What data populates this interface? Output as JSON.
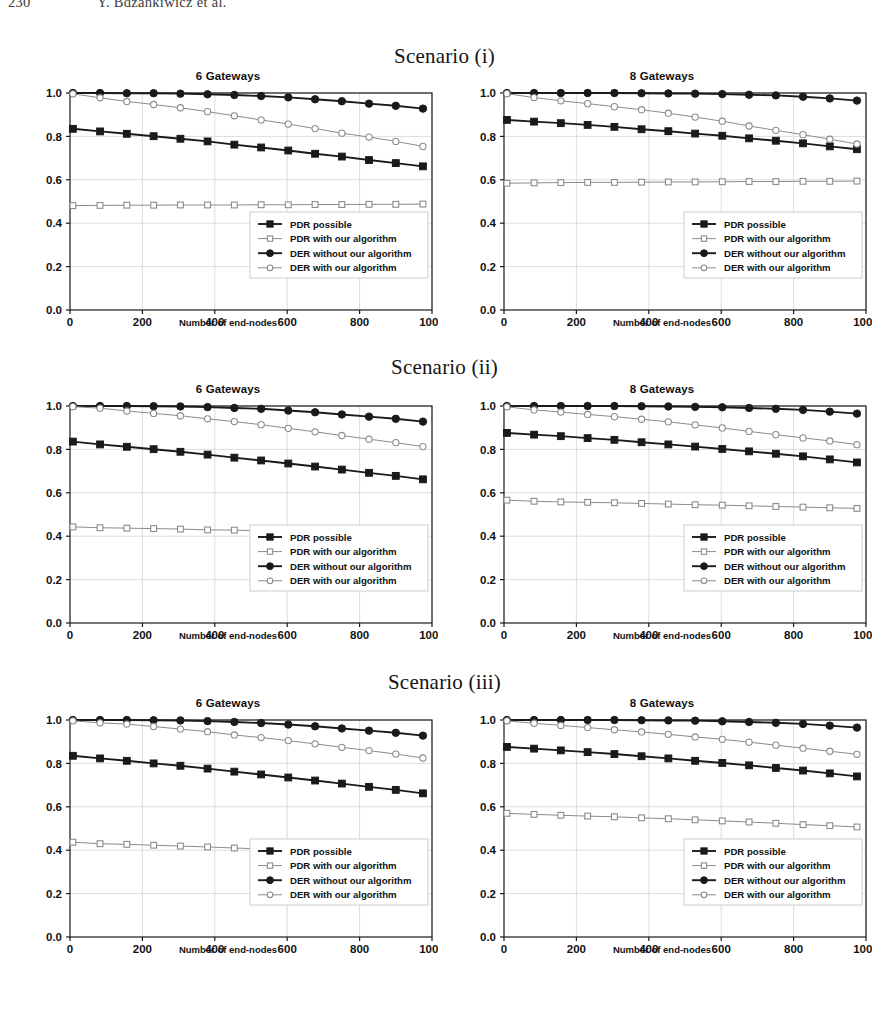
{
  "running_head": {
    "folio": "230",
    "authors": "Y. Bdzahkiwicz et al."
  },
  "scenarios": [
    {
      "caption": "Scenario (i)"
    },
    {
      "caption": "Scenario (ii)"
    },
    {
      "caption": "Scenario (iii)"
    }
  ],
  "legend_labels": [
    "PDR possible",
    "PDR with our algorithm",
    "DER without our algorithm",
    "DER with our algorithm"
  ],
  "colors": {
    "series_dark": "#1a1a1a",
    "series_light": "#8c8c8c",
    "grid": "#d9d9d9",
    "axis": "#1a1a1a",
    "background": "#ffffff",
    "legend_border": "#c8c8c8"
  },
  "chart_data": [
    {
      "type": "line",
      "title": "6 Gateways",
      "scenario": "Scenario (i)",
      "xlabel": "Number of end-nodes",
      "ylabel": "",
      "xlim": [
        0,
        1000
      ],
      "ylim": [
        0.0,
        1.0
      ],
      "xticks": [
        0,
        200,
        400,
        600,
        800,
        1000
      ],
      "yticks": [
        0.0,
        0.2,
        0.4,
        0.6,
        0.8,
        1.0
      ],
      "grid": true,
      "legend_position": "lower right",
      "x": [
        8,
        83,
        157,
        231,
        305,
        380,
        454,
        528,
        603,
        677,
        751,
        826,
        900,
        975
      ],
      "series": [
        {
          "name": "PDR possible",
          "marker": "filled-square",
          "color": "#1a1a1a",
          "values": [
            0.835,
            0.823,
            0.812,
            0.801,
            0.789,
            0.777,
            0.762,
            0.749,
            0.735,
            0.72,
            0.707,
            0.691,
            0.677,
            0.662
          ]
        },
        {
          "name": "PDR with our algorithm",
          "marker": "open-square",
          "color": "#8c8c8c",
          "values": [
            0.481,
            0.482,
            0.483,
            0.483,
            0.484,
            0.484,
            0.484,
            0.485,
            0.485,
            0.486,
            0.486,
            0.487,
            0.487,
            0.488
          ]
        },
        {
          "name": "DER without our algorithm",
          "marker": "filled-circle",
          "color": "#1a1a1a",
          "values": [
            1.0,
            1.0,
            0.999,
            0.999,
            0.997,
            0.994,
            0.991,
            0.986,
            0.98,
            0.971,
            0.962,
            0.951,
            0.941,
            0.928
          ]
        },
        {
          "name": "DER with our algorithm",
          "marker": "open-circle",
          "color": "#8c8c8c",
          "values": [
            0.996,
            0.978,
            0.961,
            0.947,
            0.932,
            0.914,
            0.895,
            0.876,
            0.857,
            0.836,
            0.815,
            0.797,
            0.777,
            0.754
          ]
        }
      ]
    },
    {
      "type": "line",
      "title": "8 Gateways",
      "scenario": "Scenario (i)",
      "xlabel": "Number of end-nodes",
      "ylabel": "",
      "xlim": [
        0,
        1000
      ],
      "ylim": [
        0.0,
        1.0
      ],
      "xticks": [
        0,
        200,
        400,
        600,
        800,
        1000
      ],
      "yticks": [
        0.0,
        0.2,
        0.4,
        0.6,
        0.8,
        1.0
      ],
      "grid": true,
      "legend_position": "lower right",
      "x": [
        8,
        83,
        157,
        231,
        305,
        380,
        454,
        528,
        603,
        677,
        751,
        826,
        900,
        975
      ],
      "series": [
        {
          "name": "PDR possible",
          "marker": "filled-square",
          "color": "#1a1a1a",
          "values": [
            0.876,
            0.868,
            0.861,
            0.853,
            0.844,
            0.833,
            0.824,
            0.813,
            0.803,
            0.791,
            0.78,
            0.768,
            0.754,
            0.741
          ]
        },
        {
          "name": "PDR with our algorithm",
          "marker": "open-square",
          "color": "#8c8c8c",
          "values": [
            0.584,
            0.586,
            0.587,
            0.588,
            0.588,
            0.589,
            0.59,
            0.59,
            0.591,
            0.592,
            0.592,
            0.593,
            0.593,
            0.594
          ]
        },
        {
          "name": "DER without our algorithm",
          "marker": "filled-circle",
          "color": "#1a1a1a",
          "values": [
            1.0,
            1.0,
            1.0,
            1.0,
            1.0,
            0.999,
            0.998,
            0.997,
            0.995,
            0.992,
            0.989,
            0.983,
            0.975,
            0.965
          ]
        },
        {
          "name": "DER with our algorithm",
          "marker": "open-circle",
          "color": "#8c8c8c",
          "values": [
            0.997,
            0.979,
            0.964,
            0.951,
            0.937,
            0.923,
            0.907,
            0.889,
            0.87,
            0.848,
            0.828,
            0.808,
            0.787,
            0.765
          ]
        }
      ]
    },
    {
      "type": "line",
      "title": "6 Gateways",
      "scenario": "Scenario (ii)",
      "xlabel": "Number of end-nodes",
      "ylabel": "",
      "xlim": [
        0,
        1000
      ],
      "ylim": [
        0.0,
        1.0
      ],
      "xticks": [
        0,
        200,
        400,
        600,
        800,
        1000
      ],
      "yticks": [
        0.0,
        0.2,
        0.4,
        0.6,
        0.8,
        1.0
      ],
      "grid": true,
      "legend_position": "lower right",
      "x": [
        8,
        83,
        157,
        231,
        305,
        380,
        454,
        528,
        603,
        677,
        751,
        826,
        900,
        975
      ],
      "series": [
        {
          "name": "PDR possible",
          "marker": "filled-square",
          "color": "#1a1a1a",
          "values": [
            0.836,
            0.823,
            0.812,
            0.801,
            0.789,
            0.776,
            0.762,
            0.749,
            0.735,
            0.721,
            0.707,
            0.692,
            0.678,
            0.662
          ]
        },
        {
          "name": "PDR with our algorithm",
          "marker": "open-square",
          "color": "#8c8c8c",
          "values": [
            0.443,
            0.439,
            0.437,
            0.435,
            0.433,
            0.429,
            0.428,
            0.424,
            0.42,
            0.418,
            0.416,
            0.413,
            0.412,
            0.409
          ]
        },
        {
          "name": "DER without our algorithm",
          "marker": "filled-circle",
          "color": "#1a1a1a",
          "values": [
            1.0,
            1.0,
            1.0,
            0.999,
            0.998,
            0.995,
            0.991,
            0.987,
            0.979,
            0.971,
            0.961,
            0.951,
            0.941,
            0.928
          ]
        },
        {
          "name": "DER with our algorithm",
          "marker": "open-circle",
          "color": "#8c8c8c",
          "values": [
            0.997,
            0.99,
            0.977,
            0.966,
            0.955,
            0.941,
            0.928,
            0.914,
            0.897,
            0.881,
            0.864,
            0.847,
            0.831,
            0.813
          ]
        }
      ]
    },
    {
      "type": "line",
      "title": "8 Gateways",
      "scenario": "Scenario (ii)",
      "xlabel": "Number of end-nodes",
      "ylabel": "",
      "xlim": [
        0,
        1000
      ],
      "ylim": [
        0.0,
        1.0
      ],
      "xticks": [
        0,
        200,
        400,
        600,
        800,
        1000
      ],
      "yticks": [
        0.0,
        0.2,
        0.4,
        0.6,
        0.8,
        1.0
      ],
      "grid": true,
      "legend_position": "lower right",
      "x": [
        8,
        83,
        157,
        231,
        305,
        380,
        454,
        528,
        603,
        677,
        751,
        826,
        900,
        975
      ],
      "series": [
        {
          "name": "PDR possible",
          "marker": "filled-square",
          "color": "#1a1a1a",
          "values": [
            0.876,
            0.868,
            0.861,
            0.852,
            0.844,
            0.833,
            0.823,
            0.813,
            0.802,
            0.791,
            0.78,
            0.768,
            0.754,
            0.74
          ]
        },
        {
          "name": "PDR with our algorithm",
          "marker": "open-square",
          "color": "#8c8c8c",
          "values": [
            0.566,
            0.561,
            0.558,
            0.556,
            0.554,
            0.551,
            0.548,
            0.545,
            0.543,
            0.54,
            0.537,
            0.534,
            0.531,
            0.528
          ]
        },
        {
          "name": "DER without our algorithm",
          "marker": "filled-circle",
          "color": "#1a1a1a",
          "values": [
            1.0,
            1.0,
            1.0,
            1.0,
            1.0,
            0.999,
            0.998,
            0.996,
            0.994,
            0.991,
            0.987,
            0.982,
            0.974,
            0.965
          ]
        },
        {
          "name": "DER with our algorithm",
          "marker": "open-circle",
          "color": "#8c8c8c",
          "values": [
            0.996,
            0.982,
            0.972,
            0.961,
            0.951,
            0.939,
            0.927,
            0.913,
            0.899,
            0.883,
            0.868,
            0.853,
            0.839,
            0.822
          ]
        }
      ]
    },
    {
      "type": "line",
      "title": "6 Gateways",
      "scenario": "Scenario (iii)",
      "xlabel": "Number of end-nodes",
      "ylabel": "",
      "xlim": [
        0,
        1000
      ],
      "ylim": [
        0.0,
        1.0
      ],
      "xticks": [
        0,
        200,
        400,
        600,
        800,
        1000
      ],
      "yticks": [
        0.0,
        0.2,
        0.4,
        0.6,
        0.8,
        1.0
      ],
      "grid": true,
      "legend_position": "lower right",
      "x": [
        8,
        83,
        157,
        231,
        305,
        380,
        454,
        528,
        603,
        677,
        751,
        826,
        900,
        975
      ],
      "series": [
        {
          "name": "PDR possible",
          "marker": "filled-square",
          "color": "#1a1a1a",
          "values": [
            0.835,
            0.823,
            0.812,
            0.8,
            0.789,
            0.776,
            0.762,
            0.749,
            0.735,
            0.721,
            0.707,
            0.692,
            0.678,
            0.662
          ]
        },
        {
          "name": "PDR with our algorithm",
          "marker": "open-square",
          "color": "#8c8c8c",
          "values": [
            0.437,
            0.43,
            0.427,
            0.423,
            0.419,
            0.415,
            0.41,
            0.406,
            0.403,
            0.399,
            0.396,
            0.391,
            0.386,
            0.38
          ]
        },
        {
          "name": "DER without our algorithm",
          "marker": "filled-circle",
          "color": "#1a1a1a",
          "values": [
            1.0,
            1.0,
            1.0,
            0.999,
            0.998,
            0.995,
            0.991,
            0.986,
            0.979,
            0.971,
            0.961,
            0.951,
            0.941,
            0.928
          ]
        },
        {
          "name": "DER with our algorithm",
          "marker": "open-circle",
          "color": "#8c8c8c",
          "values": [
            0.996,
            0.987,
            0.981,
            0.97,
            0.958,
            0.946,
            0.931,
            0.919,
            0.905,
            0.89,
            0.874,
            0.859,
            0.843,
            0.825
          ]
        }
      ]
    },
    {
      "type": "line",
      "title": "8 Gateways",
      "scenario": "Scenario (iii)",
      "xlabel": "Number of end-nodes",
      "ylabel": "",
      "xlim": [
        0,
        1000
      ],
      "ylim": [
        0.0,
        1.0
      ],
      "xticks": [
        0,
        200,
        400,
        600,
        800,
        1000
      ],
      "yticks": [
        0.0,
        0.2,
        0.4,
        0.6,
        0.8,
        1.0
      ],
      "grid": true,
      "legend_position": "lower right",
      "x": [
        8,
        83,
        157,
        231,
        305,
        380,
        454,
        528,
        603,
        677,
        751,
        826,
        900,
        975
      ],
      "series": [
        {
          "name": "PDR possible",
          "marker": "filled-square",
          "color": "#1a1a1a",
          "values": [
            0.876,
            0.868,
            0.86,
            0.852,
            0.843,
            0.833,
            0.823,
            0.812,
            0.802,
            0.791,
            0.779,
            0.767,
            0.754,
            0.74
          ]
        },
        {
          "name": "PDR with our algorithm",
          "marker": "open-square",
          "color": "#8c8c8c",
          "values": [
            0.57,
            0.565,
            0.561,
            0.557,
            0.554,
            0.549,
            0.545,
            0.54,
            0.535,
            0.53,
            0.524,
            0.518,
            0.513,
            0.507
          ]
        },
        {
          "name": "DER without our algorithm",
          "marker": "filled-circle",
          "color": "#1a1a1a",
          "values": [
            1.0,
            1.0,
            1.0,
            1.0,
            1.0,
            0.999,
            0.998,
            0.997,
            0.994,
            0.991,
            0.987,
            0.982,
            0.974,
            0.965
          ]
        },
        {
          "name": "DER with our algorithm",
          "marker": "open-circle",
          "color": "#8c8c8c",
          "values": [
            0.996,
            0.985,
            0.975,
            0.965,
            0.955,
            0.945,
            0.934,
            0.922,
            0.911,
            0.898,
            0.884,
            0.87,
            0.856,
            0.842
          ]
        }
      ]
    }
  ]
}
